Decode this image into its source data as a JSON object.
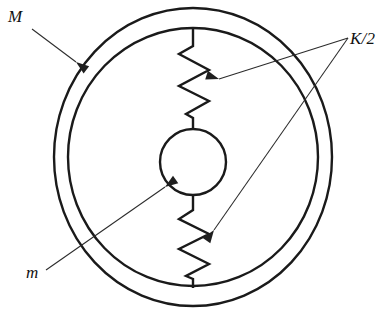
{
  "figure": {
    "title": "Mass m suspended inside annular mass M by two springs of stiffness K/2",
    "background_color": "#ffffff",
    "line_color": "#1a1a1a",
    "leader_color": "#2b2b2b",
    "stroke_width": 2.4,
    "leader_stroke_width": 1.05
  },
  "labels": {
    "outer_mass": "M",
    "inner_mass": "m",
    "spring_stiffness": "K/2"
  },
  "label_positions": {
    "outer_mass": {
      "x": 8,
      "y": 22
    },
    "inner_mass": {
      "x": 26,
      "y": 278
    },
    "spring_stiffness": {
      "x": 350,
      "y": 44
    }
  },
  "geometry": {
    "center": {
      "cx": 193,
      "cy": 157
    },
    "outer_ring": {
      "rx": 139,
      "ry": 149
    },
    "inner_ring": {
      "rx": 125,
      "ry": 129
    },
    "mass_circle": {
      "cx": 193,
      "cy": 162,
      "r": 33
    },
    "upper_spring": {
      "stem_top": {
        "x": 193,
        "y": 29
      },
      "stem_top_end": {
        "x": 193,
        "y": 46
      },
      "zigzag": [
        {
          "x": 179,
          "y": 54
        },
        {
          "x": 209,
          "y": 70
        },
        {
          "x": 179,
          "y": 86
        },
        {
          "x": 209,
          "y": 101
        },
        {
          "x": 186,
          "y": 114
        }
      ],
      "stem_bottom_start": {
        "x": 193,
        "y": 118
      },
      "stem_bottom_end": {
        "x": 193,
        "y": 129
      }
    },
    "lower_spring": {
      "stem_top": {
        "x": 193,
        "y": 195
      },
      "stem_top_end": {
        "x": 193,
        "y": 210
      },
      "zigzag": [
        {
          "x": 179,
          "y": 219
        },
        {
          "x": 209,
          "y": 234
        },
        {
          "x": 179,
          "y": 249
        },
        {
          "x": 209,
          "y": 264
        },
        {
          "x": 186,
          "y": 276
        }
      ],
      "stem_bottom_start": {
        "x": 193,
        "y": 279
      },
      "stem_bottom_end": {
        "x": 193,
        "y": 288
      }
    }
  },
  "leaders": {
    "outer_mass": {
      "from": {
        "x": 32,
        "y": 29
      },
      "to": {
        "x": 76,
        "y": 62
      },
      "arrow_angle_deg": 37
    },
    "inner_mass": {
      "from": {
        "x": 46,
        "y": 270
      },
      "to": {
        "x": 165,
        "y": 187
      },
      "arrow_angle_deg": -35
    },
    "spring_upper": {
      "from": {
        "x": 348,
        "y": 38
      },
      "to": {
        "x": 219,
        "y": 79
      },
      "arrow_angle_deg": 197
    },
    "spring_lower": {
      "from": {
        "x": 348,
        "y": 38
      },
      "to": {
        "x": 214,
        "y": 230
      },
      "arrow_angle_deg": 125
    }
  }
}
